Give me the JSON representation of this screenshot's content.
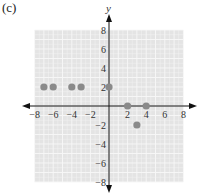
{
  "panel_label": "(c)",
  "colors": {
    "grid_background": "#e4e4e4",
    "grid_line": "#f7f7f7",
    "axis": "#111111",
    "point": "#8a8a8a",
    "text": "#333333"
  },
  "chart_data": {
    "type": "scatter",
    "title": "(c)",
    "xlabel": "",
    "ylabel": "y",
    "xlim": [
      -8,
      8
    ],
    "ylim": [
      -8,
      8
    ],
    "grid": true,
    "x_ticks": [
      -8,
      -6,
      -4,
      -2,
      2,
      4,
      6,
      8
    ],
    "y_ticks": [
      8,
      6,
      4,
      2,
      -2,
      -4,
      -6,
      -8
    ],
    "x_tick_labels": [
      "−8",
      "−6",
      "−4",
      "−2",
      "2",
      "4",
      "6",
      "8"
    ],
    "y_tick_labels": [
      "8",
      "6",
      "4",
      "2",
      "−2",
      "−4",
      "−6",
      "−8"
    ],
    "points": [
      {
        "x": -7,
        "y": 2
      },
      {
        "x": -6,
        "y": 2
      },
      {
        "x": -4,
        "y": 2
      },
      {
        "x": -3,
        "y": 2
      },
      {
        "x": 0,
        "y": 2
      },
      {
        "x": 2,
        "y": 0
      },
      {
        "x": 4,
        "y": 0
      },
      {
        "x": 3,
        "y": -2
      }
    ],
    "legend": []
  }
}
